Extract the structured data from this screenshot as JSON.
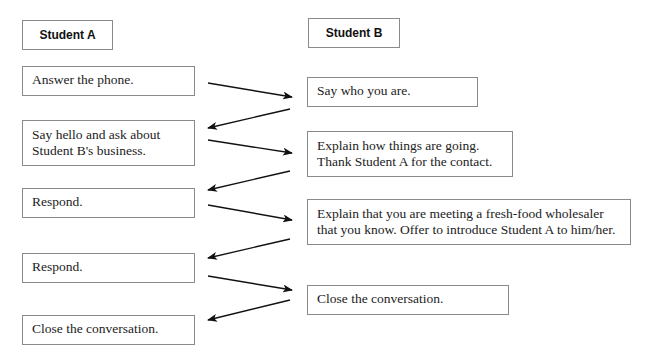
{
  "columns": {
    "student_a": {
      "label": "Student A"
    },
    "student_b": {
      "label": "Student B"
    }
  },
  "student_a_steps": [
    {
      "text": "Answer the phone."
    },
    {
      "text": "Say hello and ask about\nStudent B's business."
    },
    {
      "text": "Respond."
    },
    {
      "text": "Respond."
    },
    {
      "text": "Close the conversation."
    }
  ],
  "student_b_steps": [
    {
      "text": "Say who you are."
    },
    {
      "text": "Explain how things are going.\nThank Student A for the contact."
    },
    {
      "text": "Explain that you are meeting a fresh-food wholesaler\nthat you know. Offer to introduce Student A to him/her."
    },
    {
      "text": "Close the conversation."
    }
  ],
  "flow": [
    {
      "from": "A1",
      "to": "B1"
    },
    {
      "from": "B1",
      "to": "A2"
    },
    {
      "from": "A2",
      "to": "B2"
    },
    {
      "from": "B2",
      "to": "A3"
    },
    {
      "from": "A3",
      "to": "B3"
    },
    {
      "from": "B3",
      "to": "A4"
    },
    {
      "from": "A4",
      "to": "B4"
    },
    {
      "from": "B4",
      "to": "A5"
    }
  ],
  "colors": {
    "border": "#8a8a8a",
    "arrow": "#111111",
    "text": "#222222"
  }
}
